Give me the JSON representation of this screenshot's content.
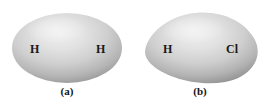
{
  "figure": {
    "background_color": "#ffffff",
    "caption_color": "#141414",
    "label_color": "#1a1a1a",
    "cloud_highlight_color": "#ececec",
    "cloud_mid_color": "#c9c9c9",
    "cloud_edge_color": "#8f8f8f",
    "panels": [
      {
        "id": "a",
        "caption": "(a)",
        "shape": "symmetric-ellipse",
        "molecule": "H2",
        "labels": [
          {
            "text": "H",
            "position": "left"
          },
          {
            "text": "H",
            "position": "right"
          }
        ]
      },
      {
        "id": "b",
        "caption": "(b)",
        "shape": "asymmetric-egg",
        "molecule": "HCl",
        "labels": [
          {
            "text": "H",
            "position": "left"
          },
          {
            "text": "Cl",
            "position": "right"
          }
        ]
      }
    ]
  }
}
